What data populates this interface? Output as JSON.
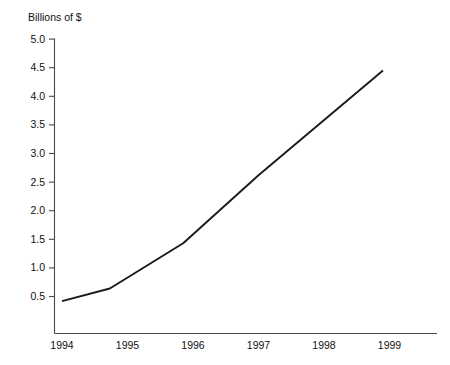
{
  "chart_data": {
    "type": "line",
    "title": "",
    "ylabel": "Billions of $",
    "xlabel": "",
    "grid": false,
    "legend": false,
    "ylim": [
      0,
      5.0
    ],
    "xlim": [
      1994,
      1999
    ],
    "y_ticks": [
      "0.5",
      "1.0",
      "1.5",
      "2.0",
      "2.5",
      "3.0",
      "3.5",
      "4.0",
      "4.5",
      "5.0"
    ],
    "y_tick_values": [
      0.5,
      1.0,
      1.5,
      2.0,
      2.5,
      3.0,
      3.5,
      4.0,
      4.5,
      5.0
    ],
    "x_ticks": [
      "1994",
      "1995",
      "1996",
      "1997",
      "1998",
      "1999"
    ],
    "x_tick_values": [
      1994,
      1995,
      1996,
      1997,
      1998,
      1999
    ],
    "series": [
      {
        "name": "Billions of $",
        "color": "#1a1a1a",
        "x": [
          1994.0,
          1994.73,
          1995.85,
          1997.0,
          1998.9
        ],
        "values": [
          0.42,
          0.64,
          1.43,
          2.62,
          4.45
        ]
      }
    ]
  },
  "axis": {
    "y_title": "Billions of $"
  }
}
